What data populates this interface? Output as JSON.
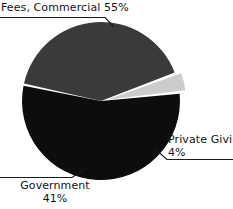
{
  "chart_data": {
    "type": "pie",
    "title": "",
    "subtitle": "",
    "xlabel": "",
    "ylabel": "",
    "legend_position": "none",
    "grid": false,
    "units": "percent",
    "total": 100,
    "categories": [
      "Fees, Commercial",
      "Government",
      "Private Giving"
    ],
    "values": [
      55,
      41,
      4
    ],
    "colors": [
      "#0d0d0d",
      "#3a3a3a",
      "#cccccc"
    ],
    "slices": [
      {
        "name": "Fees, Commercial",
        "value": 55,
        "value_text": "55%",
        "label_text": "Fees, Commercial 55%",
        "color": "#0d0d0d",
        "exploded": false,
        "start_angle": -6,
        "end_angle": 192,
        "label_lines": [
          "Fees, Commercial 55%"
        ]
      },
      {
        "name": "Government",
        "value": 41,
        "value_text": "41%",
        "label_text": "Government 41%",
        "color": "#3a3a3a",
        "exploded": false,
        "start_angle": 193,
        "end_angle": 340,
        "label_lines": [
          "Government",
          "41%"
        ]
      },
      {
        "name": "Private Giving",
        "value": 4,
        "value_text": "4%",
        "label_text": "Private Giving 4%",
        "color": "#cccccc",
        "exploded": true,
        "start_angle": 341,
        "end_angle": 354,
        "label_lines": [
          "Private Giving",
          "4%"
        ]
      }
    ],
    "geometry": {
      "center_x": 101,
      "center_y": 101,
      "radius": 79
    },
    "background_color": "#ffffff",
    "leader_line_color": "#1a1a1a"
  },
  "labels": {
    "fees": {
      "line1": "Fees, Commercial 55%"
    },
    "government": {
      "line1": "Government",
      "line2": "41%"
    },
    "private": {
      "line1": "Private Giving",
      "line2": "4%"
    }
  }
}
